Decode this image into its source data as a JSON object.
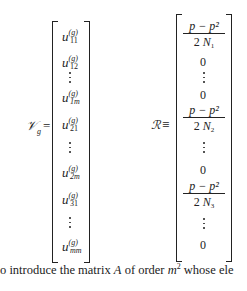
{
  "equation_left": {
    "lhs_symbol": "𝒱",
    "lhs_subscript": "g",
    "relation": "=",
    "entries": [
      {
        "base": "u",
        "sup": "(g)",
        "sub": "11",
        "type": "entry"
      },
      {
        "base": "u",
        "sup": "(g)",
        "sub": "12",
        "type": "entry"
      },
      {
        "type": "vdots"
      },
      {
        "base": "u",
        "sup": "(g)",
        "sub": "1m",
        "type": "entry"
      },
      {
        "base": "u",
        "sup": "(g)",
        "sub": "21",
        "type": "entry"
      },
      {
        "type": "vdots"
      },
      {
        "base": "u",
        "sup": "(g)",
        "sub": "2m",
        "type": "entry"
      },
      {
        "base": "u",
        "sup": "(g)",
        "sub": "31",
        "type": "entry"
      },
      {
        "type": "vdots"
      },
      {
        "base": "u",
        "sup": "(g)",
        "sub": "mm",
        "type": "entry"
      }
    ]
  },
  "equation_right": {
    "lhs_symbol": "ℛ",
    "relation": "≡",
    "entries": [
      {
        "type": "frac",
        "num": "p − p²",
        "den_coef": "2",
        "den_var": "N",
        "den_sub": "1"
      },
      {
        "type": "zero",
        "value": "0"
      },
      {
        "type": "vdots"
      },
      {
        "type": "zero",
        "value": "0"
      },
      {
        "type": "frac",
        "num": "p − p²",
        "den_coef": "2",
        "den_var": "N",
        "den_sub": "2"
      },
      {
        "type": "vdots"
      },
      {
        "type": "zero",
        "value": "0"
      },
      {
        "type": "frac",
        "num": "p − p²",
        "den_coef": "2",
        "den_var": "N",
        "den_sub": "3"
      },
      {
        "type": "vdots"
      },
      {
        "type": "zero",
        "value": "0"
      }
    ]
  },
  "body_text": {
    "t1": "o introduce the matrix ",
    "A": "A",
    "t2": " of order ",
    "m": "m",
    "exp": "2",
    "t3": " whose ele"
  }
}
